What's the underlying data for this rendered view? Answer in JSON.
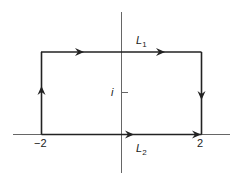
{
  "diagram": {
    "labels": {
      "top_edge": "L",
      "top_edge_sub": "1",
      "bottom_edge": "L",
      "bottom_edge_sub": "2",
      "imag_tick": "i",
      "left_point": "−2",
      "right_point": "2"
    },
    "colors": {
      "contour": "#222222",
      "axes": "#666666"
    }
  }
}
